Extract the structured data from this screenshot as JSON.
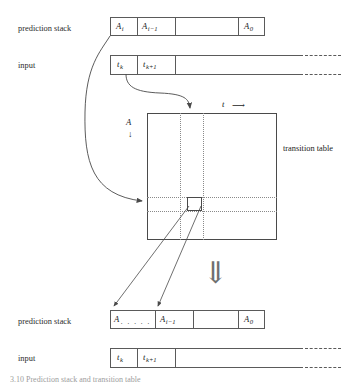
{
  "figure": {
    "caption": "3.10  Prediction stack and transition table"
  },
  "labels": {
    "prediction_stack_top": "prediction stack",
    "input_top": "input",
    "prediction_stack_bottom": "prediction stack",
    "input_bottom": "input",
    "transition_table": "transition table",
    "axis_vertical": "A",
    "axis_horizontal": "t",
    "axis_vertical_arrow": "↓",
    "axis_horizontal_arrow": "⟶",
    "big_down_arrow": "⇓"
  },
  "top_stack": {
    "cells": [
      {
        "base": "A",
        "sub": "i"
      },
      {
        "base": "A",
        "sub": "i−1"
      },
      {
        "base": "",
        "sub": ""
      },
      {
        "base": "A",
        "sub": "0"
      }
    ]
  },
  "top_input": {
    "cells": [
      {
        "base": "t",
        "sub": "k"
      },
      {
        "base": "t",
        "sub": "k+1"
      },
      {
        "base": "",
        "sub": ""
      }
    ]
  },
  "bottom_stack": {
    "cells": [
      {
        "base": "A",
        "sub": "",
        "dots": ". . . . ."
      },
      {
        "base": "A",
        "sub": "i−1"
      },
      {
        "base": "",
        "sub": ""
      },
      {
        "base": "A",
        "sub": "0"
      }
    ]
  },
  "bottom_input": {
    "cells": [
      {
        "base": "t",
        "sub": "k"
      },
      {
        "base": "t",
        "sub": "k+1"
      },
      {
        "base": "",
        "sub": ""
      }
    ]
  },
  "colors": {
    "ink": "#4a4a4a",
    "guide": "#8a8a8a",
    "background": "#ffffff"
  }
}
